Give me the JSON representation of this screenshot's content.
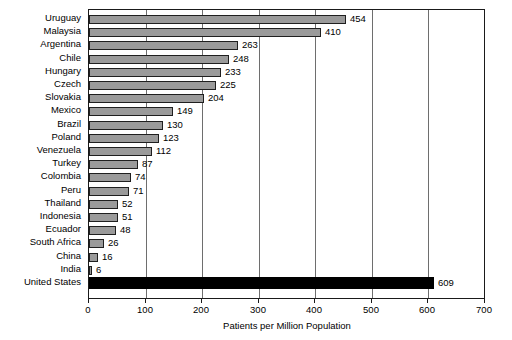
{
  "chart_data": {
    "type": "bar",
    "orientation": "horizontal",
    "title": "",
    "xlabel": "Patients per Million Population",
    "ylabel": "",
    "xlim": [
      0,
      700
    ],
    "xticks": [
      0,
      100,
      200,
      300,
      400,
      500,
      600,
      700
    ],
    "xtick_labels": [
      "0",
      "100",
      "200",
      "300",
      "400",
      "500",
      "600",
      "700"
    ],
    "grid": true,
    "grid_axis": "x",
    "legend": false,
    "categories": [
      "Uruguay",
      "Malaysia",
      "Argentina",
      "Chile",
      "Hungary",
      "Czech",
      "Slovakia",
      "Mexico",
      "Brazil",
      "Poland",
      "Venezuela",
      "Turkey",
      "Colombia",
      "Peru",
      "Thailand",
      "Indonesia",
      "Ecuador",
      "South Africa",
      "China",
      "India",
      "United States"
    ],
    "values": [
      454,
      410,
      263,
      248,
      233,
      225,
      204,
      149,
      130,
      123,
      112,
      87,
      74,
      71,
      52,
      51,
      48,
      26,
      16,
      6,
      609
    ],
    "value_labels": [
      "454",
      "410",
      "263",
      "248",
      "233",
      "225",
      "204",
      "149",
      "130",
      "123",
      "112",
      "87",
      "74",
      "71",
      "52",
      "51",
      "48",
      "26",
      "16",
      "6",
      "609"
    ],
    "highlight_category": "United States",
    "colors": {
      "bar_fill": "#9a9a9a",
      "bar_edge": "#1f1f1f",
      "highlight_fill": "#000000",
      "grid": "#6e6e6e",
      "axis": "#1a1a1a",
      "text": "#000000",
      "background": "#ffffff"
    }
  }
}
